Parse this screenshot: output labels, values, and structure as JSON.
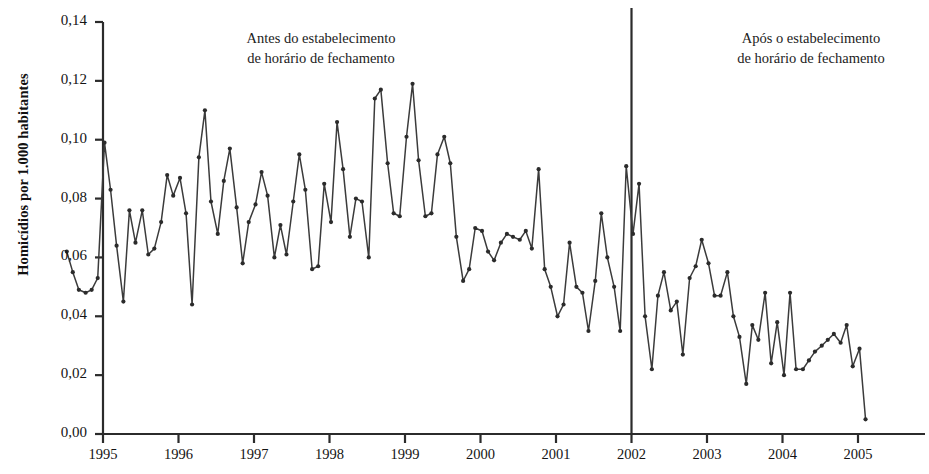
{
  "axes": {
    "ylabel": "Homicídios por 1.000 habitantes",
    "ytick_labels": [
      "0,14",
      "0,12",
      "0,10",
      "0,08",
      "0,06",
      "0,04",
      "0,02",
      "0,00"
    ],
    "xtick_labels": [
      "1995",
      "1996",
      "1997",
      "1998",
      "1999",
      "2000",
      "2001",
      "2002",
      "2003",
      "2004",
      "2005"
    ]
  },
  "annotations": {
    "before": {
      "line1": "Antes do estabelecimento",
      "line2": "de horário de fechamento"
    },
    "after": {
      "line1": "Após o estabelecimento",
      "line2": "de horário de fechamento"
    }
  },
  "colors": {
    "line": "#3b3b3b",
    "marker": "#2b2b2b",
    "axis": "#2b2b2b",
    "divider": "#2b2b2b",
    "background": "#ffffff"
  },
  "chart_data": {
    "type": "line",
    "title": "",
    "xlabel": "",
    "ylabel": "Homicídios por 1.000 habitantes",
    "ylim": [
      0.0,
      0.14
    ],
    "xlim": [
      1994.5,
      2005.17
    ],
    "ytick_values": [
      0.14,
      0.12,
      0.1,
      0.08,
      0.06,
      0.04,
      0.02,
      0.0
    ],
    "xtick_values": [
      1995,
      1996,
      1997,
      1998,
      1999,
      2000,
      2001,
      2002,
      2003,
      2004,
      2005
    ],
    "grid": false,
    "legend": "none",
    "markers": true,
    "reference_line": {
      "x": 2002.0,
      "label": "estabelecimento de horário de fechamento"
    },
    "series": [
      {
        "name": "Homicídios por 1.000 habitantes",
        "x": [
          1994.52,
          1994.6,
          1994.68,
          1994.77,
          1994.85,
          1994.93,
          1995.02,
          1995.1,
          1995.18,
          1995.27,
          1995.35,
          1995.43,
          1995.52,
          1995.6,
          1995.68,
          1995.77,
          1995.85,
          1995.93,
          1996.02,
          1996.1,
          1996.18,
          1996.27,
          1996.35,
          1996.43,
          1996.52,
          1996.6,
          1996.68,
          1996.77,
          1996.85,
          1996.93,
          1997.02,
          1997.1,
          1997.18,
          1997.27,
          1997.35,
          1997.43,
          1997.52,
          1997.6,
          1997.68,
          1997.77,
          1997.85,
          1997.93,
          1998.02,
          1998.1,
          1998.18,
          1998.27,
          1998.35,
          1998.43,
          1998.52,
          1998.6,
          1998.68,
          1998.77,
          1998.85,
          1998.93,
          1999.02,
          1999.1,
          1999.18,
          1999.27,
          1999.35,
          1999.43,
          1999.52,
          1999.6,
          1999.68,
          1999.77,
          1999.85,
          1999.93,
          2000.02,
          2000.1,
          2000.18,
          2000.27,
          2000.35,
          2000.43,
          2000.52,
          2000.6,
          2000.68,
          2000.77,
          2000.85,
          2000.93,
          2001.02,
          2001.1,
          2001.18,
          2001.27,
          2001.35,
          2001.43,
          2001.52,
          2001.6,
          2001.68,
          2001.77,
          2001.85,
          2001.93,
          2002.02,
          2002.1,
          2002.18,
          2002.27,
          2002.35,
          2002.43,
          2002.52,
          2002.6,
          2002.68,
          2002.77,
          2002.85,
          2002.93,
          2003.02,
          2003.1,
          2003.18,
          2003.27,
          2003.35,
          2003.43,
          2003.52,
          2003.6,
          2003.68,
          2003.77,
          2003.85,
          2003.93,
          2004.02,
          2004.1,
          2004.18,
          2004.27,
          2004.35,
          2004.43,
          2004.52,
          2004.6,
          2004.68,
          2004.77,
          2004.85,
          2004.93,
          2005.02,
          2005.1
        ],
        "values": [
          0.062,
          0.055,
          0.049,
          0.048,
          0.049,
          0.053,
          0.099,
          0.083,
          0.064,
          0.045,
          0.076,
          0.065,
          0.076,
          0.061,
          0.063,
          0.072,
          0.088,
          0.081,
          0.087,
          0.075,
          0.044,
          0.094,
          0.11,
          0.079,
          0.068,
          0.086,
          0.097,
          0.077,
          0.058,
          0.072,
          0.078,
          0.089,
          0.081,
          0.06,
          0.071,
          0.061,
          0.079,
          0.095,
          0.083,
          0.056,
          0.057,
          0.085,
          0.072,
          0.106,
          0.09,
          0.067,
          0.08,
          0.079,
          0.06,
          0.114,
          0.117,
          0.092,
          0.075,
          0.074,
          0.101,
          0.119,
          0.093,
          0.074,
          0.075,
          0.095,
          0.101,
          0.092,
          0.067,
          0.052,
          0.056,
          0.07,
          0.069,
          0.062,
          0.059,
          0.065,
          0.068,
          0.067,
          0.066,
          0.069,
          0.063,
          0.09,
          0.056,
          0.05,
          0.04,
          0.044,
          0.065,
          0.05,
          0.048,
          0.035,
          0.052,
          0.075,
          0.06,
          0.05,
          0.035,
          0.091,
          0.068,
          0.085,
          0.04,
          0.022,
          0.047,
          0.055,
          0.042,
          0.045,
          0.027,
          0.053,
          0.057,
          0.066,
          0.058,
          0.047,
          0.047,
          0.055,
          0.04,
          0.033,
          0.017,
          0.037,
          0.032,
          0.048,
          0.024,
          0.038,
          0.02,
          0.048,
          0.022,
          0.022,
          0.025,
          0.028,
          0.03,
          0.032,
          0.034,
          0.031,
          0.037,
          0.023,
          0.029,
          0.005
        ]
      }
    ]
  }
}
